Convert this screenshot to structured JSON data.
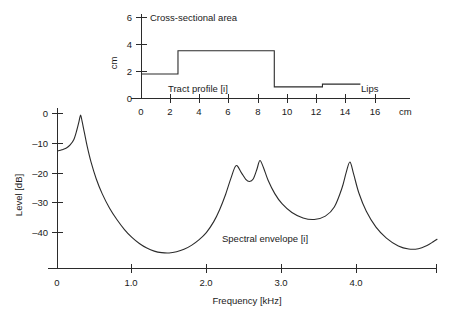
{
  "figure": {
    "background": "#ffffff",
    "ink_color": "#2b2b2b"
  },
  "chart_data": [
    {
      "id": "vocal-tract-profile",
      "type": "area",
      "title": "Cross-sectional area",
      "annotation_left": "Tract profile [i]",
      "annotation_right": "Lips",
      "xlabel": "cm",
      "ylabel": "cm",
      "xlim": [
        0,
        18.4
      ],
      "ylim": [
        0,
        6.6
      ],
      "xticks": [
        0,
        2,
        4,
        6,
        8,
        10,
        12,
        14,
        16
      ],
      "xticklabels": [
        "0",
        "2",
        "4",
        "6",
        "8",
        "10",
        "12",
        "14",
        "16"
      ],
      "yticks": [
        0,
        2,
        4,
        6
      ],
      "yticklabels": [
        "0",
        "2",
        "4",
        "6"
      ],
      "grid": false,
      "legend": "none",
      "step_edges": [
        0.0,
        2.5,
        9.1,
        12.4,
        15.0
      ],
      "step_values": [
        1.8,
        3.5,
        0.85,
        1.05
      ],
      "x": [
        0.0,
        2.5,
        2.5,
        9.1,
        9.1,
        12.4,
        12.4,
        15.0
      ],
      "y": [
        1.8,
        1.8,
        3.5,
        3.5,
        0.85,
        0.85,
        1.05,
        1.05
      ]
    },
    {
      "id": "spectral-envelope",
      "type": "line",
      "title": "",
      "annotation": "Spectral envelope [i]",
      "xlabel": "Frequency [kHz]",
      "ylabel": "Level [dB]",
      "xlim": [
        0,
        5.1
      ],
      "ylim": [
        -50,
        2
      ],
      "xticks": [
        0,
        1.0,
        2.0,
        3.0,
        4.0
      ],
      "xticklabels": [
        "0",
        "1.0",
        "2.0",
        "3.0",
        "4.0"
      ],
      "yticks": [
        0,
        -10,
        -20,
        -30,
        -40
      ],
      "yticklabels": [
        "0",
        "–10",
        "–20",
        "–30",
        "–40"
      ],
      "grid": false,
      "legend": "none",
      "formants_khz": [
        0.31,
        2.4,
        2.72,
        3.93
      ],
      "formant_levels_db": [
        0.5,
        -16.0,
        -14.5,
        -15.0
      ],
      "x": [
        0.0,
        0.06,
        0.12,
        0.17,
        0.22,
        0.26,
        0.29,
        0.31,
        0.33,
        0.36,
        0.4,
        0.45,
        0.52,
        0.6,
        0.7,
        0.8,
        0.9,
        1.0,
        1.1,
        1.2,
        1.3,
        1.4,
        1.5,
        1.6,
        1.7,
        1.8,
        1.9,
        2.0,
        2.1,
        2.18,
        2.26,
        2.33,
        2.4,
        2.47,
        2.53,
        2.58,
        2.63,
        2.68,
        2.72,
        2.77,
        2.83,
        2.92,
        3.02,
        3.15,
        3.3,
        3.45,
        3.6,
        3.72,
        3.82,
        3.88,
        3.93,
        3.98,
        4.05,
        4.15,
        4.28,
        4.42,
        4.58,
        4.72,
        4.85,
        4.96,
        5.05,
        5.1
      ],
      "y": [
        -11.4,
        -11.0,
        -10.4,
        -9.4,
        -7.6,
        -4.5,
        -1.6,
        0.4,
        -1.6,
        -5.2,
        -10.0,
        -15.0,
        -20.5,
        -25.4,
        -30.2,
        -34.0,
        -37.2,
        -39.8,
        -41.8,
        -43.3,
        -44.3,
        -44.8,
        -44.9,
        -44.5,
        -43.7,
        -42.4,
        -40.6,
        -38.2,
        -34.6,
        -30.6,
        -25.6,
        -20.4,
        -16.2,
        -18.5,
        -20.7,
        -21.4,
        -20.6,
        -17.4,
        -14.5,
        -17.0,
        -21.0,
        -25.4,
        -28.8,
        -31.6,
        -33.4,
        -33.9,
        -32.8,
        -29.8,
        -23.8,
        -18.4,
        -15.0,
        -19.0,
        -25.2,
        -31.2,
        -36.4,
        -40.0,
        -42.6,
        -43.6,
        -43.5,
        -42.5,
        -41.2,
        -40.4
      ]
    }
  ],
  "labels": {
    "top_title": "Cross-sectional area",
    "top_ylabel": "cm",
    "top_xunit": "cm",
    "top_annot_left": "Tract profile [i]",
    "top_annot_right": "Lips",
    "bottom_ylabel": "Level [dB]",
    "bottom_xlabel": "Frequency [kHz]",
    "bottom_annot": "Spectral envelope [i]"
  }
}
